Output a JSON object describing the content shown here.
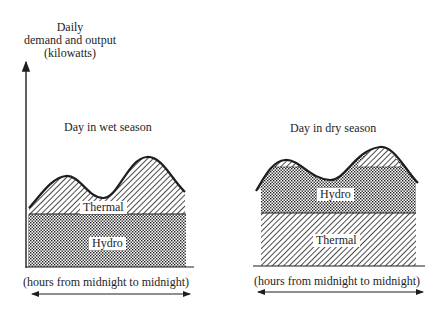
{
  "y_axis_label": [
    "Daily",
    "demand and output",
    "(kilowatts)"
  ],
  "panels": [
    {
      "title": "Day in wet season",
      "bottom_layer": "Hydro",
      "top_layer": "Thermal",
      "x_axis_label": "(hours from midnight to midnight)"
    },
    {
      "title": "Day in dry season",
      "bottom_layer": "Thermal",
      "top_layer": "Hydro",
      "x_axis_label": "(hours from midnight to midnight)"
    }
  ],
  "colors": {
    "ink": "#1e1e1e",
    "background": "#ffffff"
  }
}
